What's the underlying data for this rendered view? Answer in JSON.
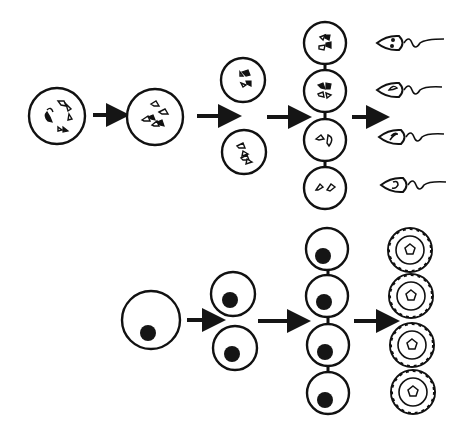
{
  "diagram": {
    "type": "cell-division-schematic",
    "colors": {
      "ink": "#111111",
      "background": "#ffffff"
    },
    "rows": [
      {
        "name": "top-row",
        "stages": [
          {
            "id": "primary-cell",
            "count": 1,
            "shape": "circle-with-chromosomes"
          },
          {
            "id": "replicated-cell",
            "count": 1,
            "shape": "circle-with-chromosome-pairs"
          },
          {
            "id": "secondary-cells",
            "count": 2,
            "shape": "circle-with-chromosomes"
          },
          {
            "id": "connected-cells",
            "count": 4,
            "shape": "bridged-circle-column"
          },
          {
            "id": "flagellated-cells",
            "count": 4,
            "shape": "head-with-tail"
          }
        ],
        "arrows": 4
      },
      {
        "name": "bottom-row",
        "stages": [
          {
            "id": "large-cell",
            "count": 1,
            "shape": "circle-with-nucleus"
          },
          {
            "id": "daughter-cells",
            "count": 2,
            "shape": "circle-with-nucleus"
          },
          {
            "id": "connected-cells",
            "count": 4,
            "shape": "bridged-circle-column"
          },
          {
            "id": "follicle-cells",
            "count": 4,
            "shape": "ringed-circle-with-pentagon"
          }
        ],
        "arrows": 3
      }
    ]
  }
}
